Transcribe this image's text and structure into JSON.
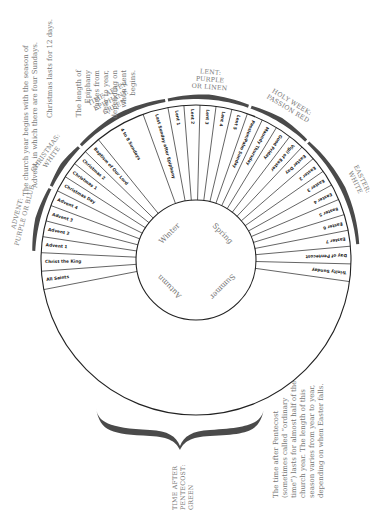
{
  "diagram": {
    "title": "The Church Year",
    "center": {
      "cx": 196,
      "cy": 260
    },
    "outer_radius": 155,
    "inner_radius": 60,
    "start_angle_deg": 169,
    "end_angle_deg": 368,
    "segments": [
      {
        "label": "All Saints",
        "weight": 1.15
      },
      {
        "label": "Christ the King",
        "weight": 1.15
      },
      {
        "label": "Advent 1",
        "weight": 1
      },
      {
        "label": "Advent 2",
        "weight": 1
      },
      {
        "label": "Advent 3",
        "weight": 1
      },
      {
        "label": "Advent 4",
        "weight": 1
      },
      {
        "label": "Christmas Day",
        "weight": 1
      },
      {
        "label": "Christmas 1",
        "weight": 1
      },
      {
        "label": "Christmas 2",
        "weight": 1
      },
      {
        "label": "Baptism of Our Lord",
        "weight": 1.1
      },
      {
        "label": "4 to 8 Sundays",
        "weight": 3.2
      },
      {
        "label": "Last Sunday after Epiphany",
        "weight": 1.6
      },
      {
        "label": "Lent 1",
        "weight": 1
      },
      {
        "label": "Lent 2",
        "weight": 1
      },
      {
        "label": "Lent 3",
        "weight": 1
      },
      {
        "label": "Lent 4",
        "weight": 1
      },
      {
        "label": "Lent 5",
        "weight": 1
      },
      {
        "label": "Passion/Palm Sunday",
        "weight": 1
      },
      {
        "label": "Maundy Thursday",
        "weight": 1
      },
      {
        "label": "Good Friday",
        "weight": 1
      },
      {
        "label": "Vigil of Easter",
        "weight": 1
      },
      {
        "label": "Easter Day",
        "weight": 1
      },
      {
        "label": "Easter 2",
        "weight": 1
      },
      {
        "label": "Easter 3",
        "weight": 1
      },
      {
        "label": "Easter 4",
        "weight": 1
      },
      {
        "label": "Easter 5",
        "weight": 1
      },
      {
        "label": "Easter 6",
        "weight": 1
      },
      {
        "label": "Easter 7",
        "weight": 1
      },
      {
        "label": "Day of Pentecost",
        "weight": 1.1
      },
      {
        "label": "Trinity Sunday",
        "weight": 1.1
      }
    ],
    "natural_seasons": [
      {
        "label": "Winter",
        "angle": 225
      },
      {
        "label": "Spring",
        "angle": 315
      },
      {
        "label": "Summer",
        "angle": 45
      },
      {
        "label": "Autumn",
        "angle": 135
      }
    ],
    "liturgical_seasons": [
      {
        "name": "Advent",
        "color": "Purple or Blue",
        "text": [
          "ADVENT:",
          "PURPLE OR BLUE"
        ],
        "from": 2,
        "to": 5
      },
      {
        "name": "Christmas",
        "color": "White",
        "text": [
          "CHRISTMAS:",
          "WHITE"
        ],
        "from": 6,
        "to": 8
      },
      {
        "name": "Time after Epiphany",
        "color": "Green",
        "text": [
          "TIME AFTER",
          "EPIPHANY:",
          "GREEN"
        ],
        "from": 9,
        "to": 11
      },
      {
        "name": "Lent",
        "color": "Purple or Linen",
        "text": [
          "LENT:",
          "PURPLE",
          "OR LINEN"
        ],
        "from": 12,
        "to": 16
      },
      {
        "name": "Holy Week",
        "color": "Passion Red",
        "text": [
          "HOLY WEEK:",
          "PASSION RED"
        ],
        "from": 17,
        "to": 20
      },
      {
        "name": "Easter",
        "color": "White",
        "text": [
          "EASTER:",
          "WHITE"
        ],
        "from": 21,
        "to": 27
      }
    ],
    "pentecost_season": {
      "text": [
        "TIME AFTER",
        "PENTECOST:",
        "GREEN"
      ]
    }
  },
  "captions": {
    "advent": [
      "The church year begins with the season of",
      "Advent, in which there are four Sundays."
    ],
    "christmas": [
      "Christmas lasts for 12 days."
    ],
    "epiphany": [
      "The length of",
      "Epiphany",
      "varies from",
      "year to year,",
      "depending on",
      "when Lent",
      "begins."
    ],
    "pentecost": [
      "The time after Pentecost",
      "(sometimes called “ordinary",
      "time”) lasts for almost half of the",
      "church year. The length of this",
      "season varies from year to year,",
      "depending on when Easter falls."
    ]
  },
  "colors": {
    "line": "#222222",
    "brace": "#4a4a4a",
    "text_gray": "#777777",
    "background": "#ffffff"
  }
}
